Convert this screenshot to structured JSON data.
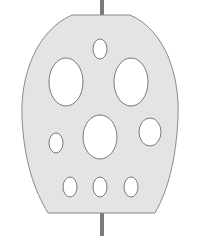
{
  "diagram": {
    "colors": {
      "background": "#ffffff",
      "plate_fill": "#e4e4e4",
      "plate_stroke": "#8a8a8a",
      "hole_fill": "#ffffff",
      "hole_stroke": "#7a7a7a",
      "rod": "#7b7b7b"
    },
    "rod": {
      "x": 100,
      "width": 4,
      "top": {
        "y1": 0,
        "y2": 16
      },
      "bottom": {
        "y1": 213,
        "y2": 236
      }
    },
    "plate": {
      "path": "M72,15 L130,15 C165,30 180,75 178,118 C176,160 168,190 155,213 L48,213 C34,190 24,160 22,118 C20,75 37,30 72,15 Z"
    },
    "holes": [
      {
        "name": "top-small-hole",
        "cx": 100,
        "cy": 49,
        "rx": 7,
        "ry": 10
      },
      {
        "name": "upper-left-large-hole",
        "cx": 66,
        "cy": 82,
        "rx": 17,
        "ry": 24
      },
      {
        "name": "upper-right-large-hole",
        "cx": 131,
        "cy": 82,
        "rx": 17,
        "ry": 24
      },
      {
        "name": "center-large-hole",
        "cx": 100,
        "cy": 137,
        "rx": 17,
        "ry": 22
      },
      {
        "name": "middle-left-small-hole",
        "cx": 56,
        "cy": 143,
        "rx": 7,
        "ry": 10
      },
      {
        "name": "middle-right-medium-hole",
        "cx": 150,
        "cy": 132,
        "rx": 11,
        "ry": 14
      },
      {
        "name": "bottom-left-small-hole",
        "cx": 70,
        "cy": 187,
        "rx": 7,
        "ry": 10
      },
      {
        "name": "bottom-center-small-hole",
        "cx": 100,
        "cy": 187,
        "rx": 7,
        "ry": 10
      },
      {
        "name": "bottom-right-small-hole",
        "cx": 131,
        "cy": 187,
        "rx": 7,
        "ry": 10
      }
    ]
  }
}
